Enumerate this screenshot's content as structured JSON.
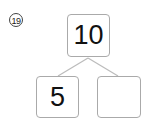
{
  "problem": {
    "number_label": "⑲"
  },
  "number_bond": {
    "whole": "10",
    "parts": [
      "5",
      ""
    ]
  },
  "colors": {
    "box_border": "#aaaaaa",
    "line": "#bbbbbb",
    "text": "#111111"
  }
}
